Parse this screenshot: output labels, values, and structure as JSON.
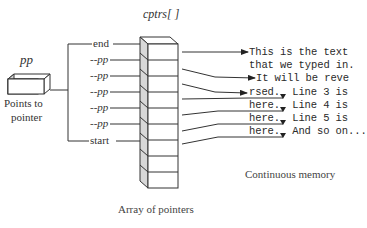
{
  "diagram": {
    "pointer_var": {
      "name": "pp",
      "caption_lines": [
        "Points to",
        "pointer"
      ]
    },
    "array": {
      "name": "cptrs[ ]",
      "caption": "Array of pointers",
      "row_count": 9,
      "labels": [
        "end",
        "--pp",
        "--pp",
        "--pp",
        "--pp",
        "--pp",
        "start"
      ]
    },
    "memory": {
      "caption": "Continuous memory",
      "lines": [
        "This is the text",
        "that we typed in.",
        " It will be reve",
        "rsed.  Line 3 is",
        "here.  Line 4 is",
        "here.  Line 5 is",
        "here.  And so on..."
      ],
      "segments": [
        {
          "underlined": "rsed.",
          "rest": " Line 3 is"
        },
        {
          "underlined": "here.",
          "rest": " Line 4 is"
        },
        {
          "underlined": "here.",
          "rest": " Line 5 is"
        },
        {
          "underlined": "here.",
          "rest": " And so on..."
        }
      ]
    },
    "colors": {
      "stroke": "#333333",
      "side_face": "#d8d8d8",
      "text": "#333333"
    }
  }
}
